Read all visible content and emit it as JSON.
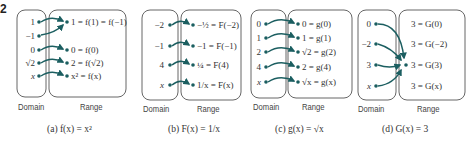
{
  "edge_mark": "2",
  "colors": {
    "arrow": "#1b5e60",
    "box": "#555555",
    "text": "#333333"
  },
  "diagrams": [
    {
      "id": "a",
      "domain_label": "Domain",
      "range_label": "Range",
      "caption": "(a) f(x) = x²",
      "domain": [
        "1",
        "−1",
        "0",
        "√2",
        "x"
      ],
      "range": [
        "1 = f(1) = f(−1)",
        "0 = f(0)",
        "2 = f(√2)",
        "x² = f(x)"
      ],
      "mappings": [
        [
          "1",
          "1"
        ],
        [
          "−1",
          "1"
        ],
        [
          "0",
          "0"
        ],
        [
          "√2",
          "2"
        ],
        [
          "x",
          "x²"
        ]
      ]
    },
    {
      "id": "b",
      "domain_label": "Domain",
      "range_label": "Range",
      "caption": "(b) F(x) = 1/x",
      "domain": [
        "−2",
        "−1",
        "4",
        "x"
      ],
      "range": [
        "−½ = F(−2)",
        "−1 = F(−1)",
        "¼ = F(4)",
        "1/x = F(x)"
      ],
      "mappings": [
        [
          "−2",
          "−½"
        ],
        [
          "−1",
          "−1"
        ],
        [
          "4",
          "¼"
        ],
        [
          "x",
          "1/x"
        ]
      ]
    },
    {
      "id": "c",
      "domain_label": "Domain",
      "range_label": "Range",
      "caption": "(c) g(x) = √x",
      "domain": [
        "0",
        "1",
        "2",
        "4",
        "x"
      ],
      "range": [
        "0 = g(0)",
        "1 = g(1)",
        "√2 = g(2)",
        "2 = g(4)",
        "√x = g(x)"
      ],
      "mappings": [
        [
          "0",
          "0"
        ],
        [
          "1",
          "1"
        ],
        [
          "2",
          "√2"
        ],
        [
          "4",
          "2"
        ],
        [
          "x",
          "√x"
        ]
      ]
    },
    {
      "id": "d",
      "domain_label": "Domain",
      "range_label": "Range",
      "caption": "(d) G(x) = 3",
      "domain": [
        "0",
        "−2",
        "3",
        "x"
      ],
      "range": [
        "3 = G(0)",
        "3 = G(−2)",
        "3 = G(3)",
        "3 = G(x)"
      ],
      "mappings": [
        [
          "0",
          "3"
        ],
        [
          "−2",
          "3"
        ],
        [
          "3",
          "3"
        ],
        [
          "x",
          "3"
        ]
      ]
    }
  ]
}
